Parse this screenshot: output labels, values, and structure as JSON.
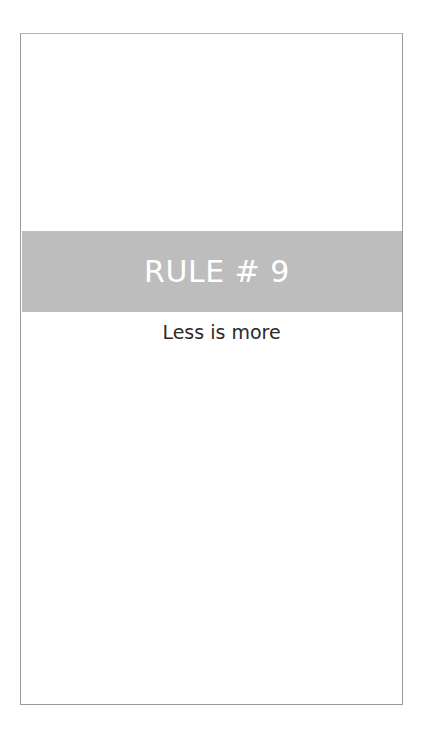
{
  "card": {
    "band": {
      "title": "RULE # 9",
      "color": "#bdbdbd"
    },
    "subtitle": "Less is more"
  }
}
